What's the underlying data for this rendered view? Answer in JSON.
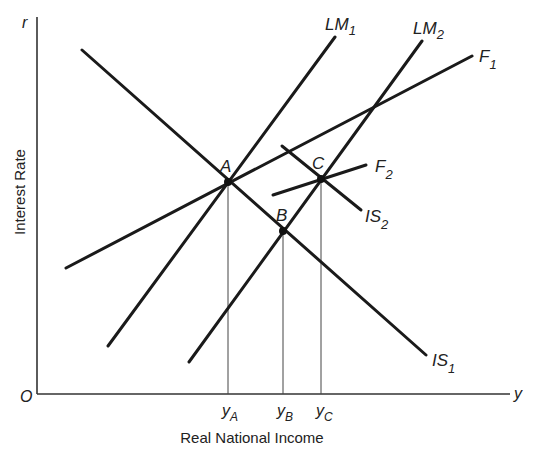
{
  "diagram": {
    "type": "IS-LM-F diagram",
    "axes": {
      "x": {
        "symbol": "y",
        "title": "Real National Income"
      },
      "y": {
        "symbol": "r",
        "title": "Interest Rate"
      },
      "origin": "O"
    },
    "curves": [
      {
        "id": "IS1",
        "base": "IS",
        "sub": "1"
      },
      {
        "id": "IS2",
        "base": "IS",
        "sub": "2"
      },
      {
        "id": "LM1",
        "base": "LM",
        "sub": "1"
      },
      {
        "id": "LM2",
        "base": "LM",
        "sub": "2"
      },
      {
        "id": "F1",
        "base": "F",
        "sub": "1"
      },
      {
        "id": "F2",
        "base": "F",
        "sub": "2"
      }
    ],
    "points": [
      {
        "label": "A",
        "on": [
          "IS1",
          "LM1",
          "F1"
        ]
      },
      {
        "label": "B",
        "on": [
          "IS1",
          "LM2"
        ]
      },
      {
        "label": "C",
        "on": [
          "IS2",
          "LM2",
          "F2"
        ]
      }
    ],
    "x_ticks": [
      {
        "base": "y",
        "sub": "A"
      },
      {
        "base": "y",
        "sub": "B"
      },
      {
        "base": "y",
        "sub": "C"
      }
    ],
    "colors": {
      "line": "#1a1a1a",
      "background": "#ffffff"
    }
  }
}
